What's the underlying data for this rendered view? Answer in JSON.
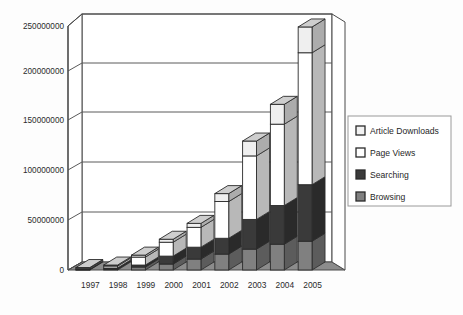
{
  "chart_data": {
    "type": "bar",
    "subtype": "stacked-bar-3d",
    "title": "",
    "subtitle": "",
    "xlabel": "",
    "ylabel": "",
    "categories": [
      "1997",
      "1998",
      "1999",
      "2000",
      "2001",
      "2002",
      "2003",
      "2004",
      "2005"
    ],
    "series": [
      {
        "name": "Browsing",
        "color": "#808080",
        "values": [
          500000,
          1000000,
          3000000,
          6000000,
          11000000,
          16000000,
          21000000,
          26000000,
          29000000
        ]
      },
      {
        "name": "Searching",
        "color": "#3a3a3a",
        "values": [
          500000,
          1000000,
          2000000,
          8000000,
          12000000,
          16000000,
          30000000,
          39000000,
          57000000
        ]
      },
      {
        "name": "Page Views",
        "color": "#ffffff",
        "values": [
          1000000,
          2000000,
          8000000,
          14000000,
          20000000,
          37000000,
          64000000,
          82000000,
          133000000
        ]
      },
      {
        "name": "Article Downloads",
        "color": "#efefef",
        "values": [
          500000,
          1000000,
          2000000,
          3000000,
          4000000,
          8000000,
          15000000,
          20000000,
          26000000
        ]
      }
    ],
    "totals": [
      2500000,
      5000000,
      15000000,
      31000000,
      47000000,
      77000000,
      130000000,
      167000000,
      245000000
    ],
    "ylim": [
      0,
      250000000
    ],
    "yticks": [
      0,
      50000000,
      100000000,
      150000000,
      200000000,
      250000000
    ],
    "ytick_labels": [
      "0",
      "50000000",
      "100000000",
      "150000000",
      "200000000",
      "250000000"
    ],
    "grid": true,
    "grid_axis": "y",
    "legend_position": "right",
    "legend_entries": [
      {
        "label": "Article Downloads",
        "swatch": "#f2f2f2"
      },
      {
        "label": "Page Views",
        "swatch": "#ffffff"
      },
      {
        "label": "Searching",
        "swatch": "#3a3a3a"
      },
      {
        "label": "Browsing",
        "swatch": "#808080"
      }
    ]
  },
  "colors": {
    "background": "#fdfdfd",
    "axis_line": "#4a4a4a",
    "grid_line": "#5a5a5a",
    "floor": "#8c8c8c",
    "wall": "#ffffff",
    "legend_border": "#9a9a9a",
    "bar_outline": "#2a2a2a",
    "text": "#2b2b2b"
  }
}
